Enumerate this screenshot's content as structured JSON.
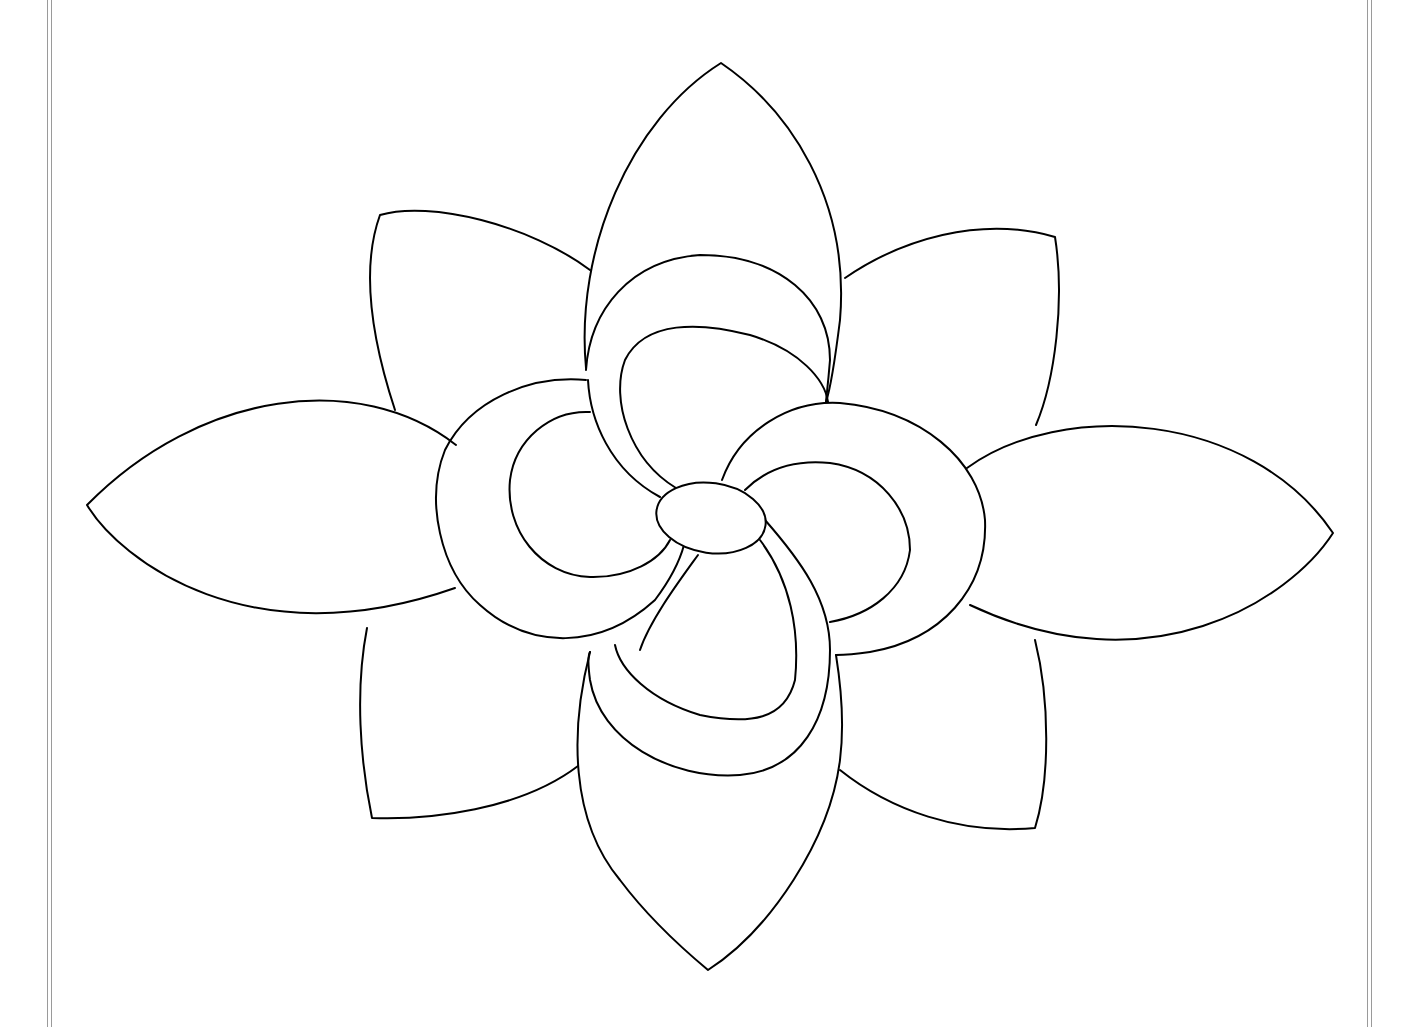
{
  "page": {
    "type": "coloring-page",
    "background_color": "#ffffff",
    "line_color": "#000000",
    "border_color": "#9a9a9a"
  },
  "flower": {
    "outer_petals": 8,
    "inner_swirl_petals": 4,
    "center": "oval"
  }
}
